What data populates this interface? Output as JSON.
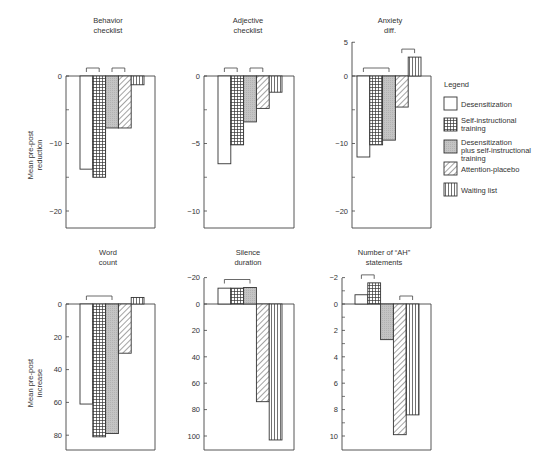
{
  "legend": {
    "title": "Legend",
    "items": [
      {
        "key": "desens",
        "label_lines": [
          "Desensitization"
        ],
        "pattern": "white"
      },
      {
        "key": "sit",
        "label_lines": [
          "Self-instructional",
          "training"
        ],
        "pattern": "grid"
      },
      {
        "key": "combined",
        "label_lines": [
          "Desensitization",
          "plus self-instructional",
          "training"
        ],
        "pattern": "gray"
      },
      {
        "key": "attention",
        "label_lines": [
          "Attention-placebo"
        ],
        "pattern": "diagonal"
      },
      {
        "key": "waiting",
        "label_lines": [
          "Waiting list"
        ],
        "pattern": "vertical"
      }
    ]
  },
  "ylabels": {
    "top_row": [
      "Mean pre-post",
      "reduction"
    ],
    "bottom_row": [
      "Mean pre-post",
      "increase"
    ]
  },
  "chart_data": [
    {
      "type": "bar",
      "title": "Behavior checklist",
      "title_lines": [
        "Behavior",
        "checklist"
      ],
      "categories": [
        "Desensitization",
        "Self-instructional training",
        "Desensitization plus self-instructional training",
        "Attention-placebo",
        "Waiting list"
      ],
      "values": [
        -13.8,
        -15.0,
        -7.7,
        -7.7,
        -1.3
      ],
      "ylabel": "Mean pre-post reduction",
      "yticks": [
        0,
        -10,
        -20
      ],
      "yminor": [
        -5,
        -15
      ],
      "ylim": [
        -22,
        0
      ],
      "brackets": [
        [
          0,
          1
        ],
        [
          2,
          3
        ]
      ]
    },
    {
      "type": "bar",
      "title": "Adjective checklist",
      "title_lines": [
        "Adjective",
        "checklist"
      ],
      "categories": [
        "Desensitization",
        "Self-instructional training",
        "Desensitization plus self-instructional training",
        "Attention-placebo",
        "Waiting list"
      ],
      "values": [
        -6.5,
        -5.1,
        -3.4,
        -2.4,
        -1.2
      ],
      "ylabel": "",
      "yticks": [
        0,
        -5,
        -10
      ],
      "yminor": [
        -2.5,
        -7.5
      ],
      "ylim": [
        -11,
        0
      ],
      "brackets": [
        [
          0,
          1
        ],
        [
          2,
          3
        ]
      ]
    },
    {
      "type": "bar",
      "title": "Anxiety diff.",
      "title_lines": [
        "Anxiety",
        "diff."
      ],
      "categories": [
        "Desensitization",
        "Self-instructional training",
        "Desensitization plus self-instructional training",
        "Attention-placebo",
        "Waiting list"
      ],
      "values": [
        -12.0,
        -10.2,
        -9.5,
        -4.6,
        2.8
      ],
      "ylabel": "",
      "yticks": [
        5,
        0,
        -10,
        -20
      ],
      "yminor": [
        -5,
        -15
      ],
      "ylim": [
        -22,
        5
      ],
      "brackets": [
        [
          0,
          2
        ],
        [
          3,
          4
        ]
      ]
    },
    {
      "type": "bar",
      "title": "Word count",
      "title_lines": [
        "Word",
        "count"
      ],
      "categories": [
        "Desensitization",
        "Self-instructional training",
        "Desensitization plus self-instructional training",
        "Attention-placebo",
        "Waiting list"
      ],
      "values": [
        61,
        81,
        79,
        30,
        -4
      ],
      "ylabel": "Mean pre-post increase",
      "yticks": [
        0,
        20,
        40,
        60,
        80
      ],
      "yminor": [],
      "ylim": [
        0,
        89
      ],
      "inverted": true,
      "brackets": [
        [
          0,
          2
        ]
      ]
    },
    {
      "type": "bar",
      "title": "Silence duration",
      "title_lines": [
        "Silence",
        "duration"
      ],
      "categories": [
        "Desensitization",
        "Self-instructional training",
        "Desensitization plus self-instructional training",
        "Attention-placebo",
        "Waiting list"
      ],
      "values": [
        -12,
        -12,
        -12.5,
        74,
        103
      ],
      "ylabel": "",
      "yticks": [
        -20,
        0,
        20,
        40,
        60,
        80,
        100
      ],
      "yminor": [],
      "ylim": [
        -20,
        109
      ],
      "inverted": true,
      "brackets": [
        [
          0,
          2
        ]
      ]
    },
    {
      "type": "bar",
      "title": "Number of \"AH\" statements",
      "title_lines": [
        "Number of “AH”",
        "statements"
      ],
      "categories": [
        "Desensitization",
        "Self-instructional training",
        "Desensitization plus self-instructional training",
        "Attention-placebo",
        "Waiting list"
      ],
      "values": [
        -0.7,
        -1.6,
        2.7,
        9.9,
        8.4
      ],
      "ylabel": "",
      "yticks": [
        -2,
        0,
        2,
        4,
        6,
        8,
        10
      ],
      "yminor": [
        -1,
        1,
        3,
        5,
        7,
        9
      ],
      "ylim": [
        -2,
        11
      ],
      "inverted": true,
      "brackets": [
        [
          0,
          1
        ],
        [
          3,
          4
        ]
      ]
    }
  ]
}
